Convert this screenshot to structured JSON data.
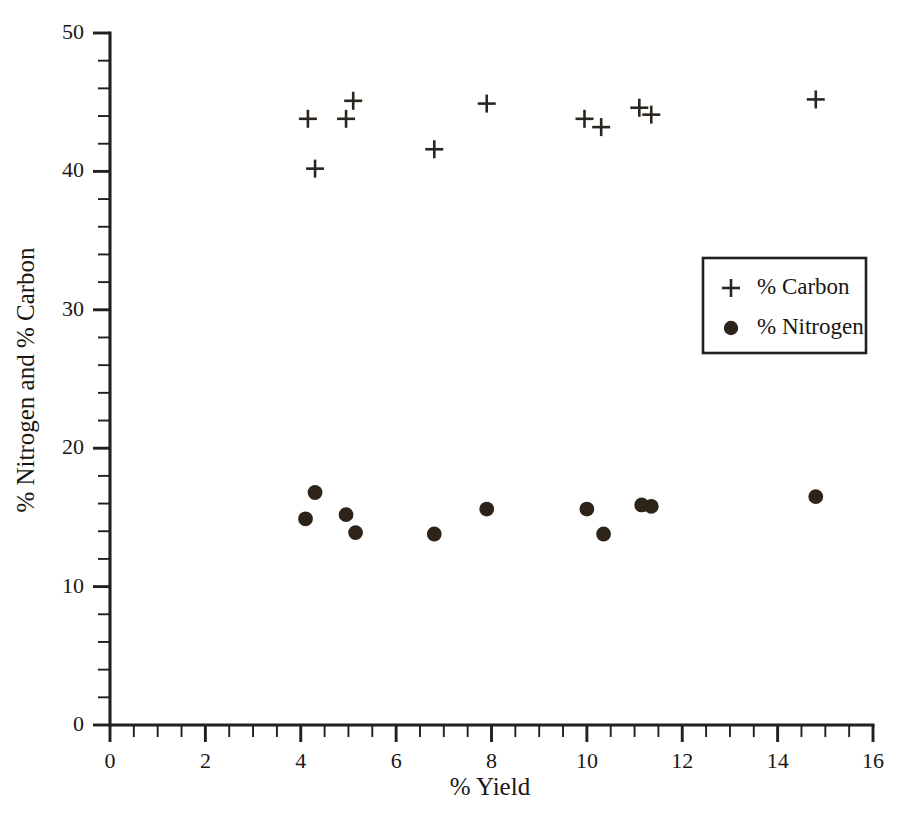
{
  "chart_data": {
    "type": "scatter",
    "title": "",
    "xlabel": "% Yield",
    "ylabel": "% Nitrogen and % Carbon",
    "xlim": [
      0,
      16
    ],
    "ylim": [
      0,
      50
    ],
    "x_major_ticks": [
      0,
      2,
      4,
      6,
      8,
      10,
      12,
      14,
      16
    ],
    "x_minor_step": 0.5,
    "y_major_ticks": [
      0,
      10,
      20,
      30,
      40,
      50
    ],
    "y_minor_step": 2,
    "x_tick_labels": [
      "0",
      "2",
      "4",
      "6",
      "8",
      "10",
      "12",
      "14",
      "16"
    ],
    "y_tick_labels": [
      "0",
      "10",
      "20",
      "30",
      "40",
      "50"
    ],
    "grid": false,
    "legend_position": "middle-right",
    "series": [
      {
        "name": "% Carbon",
        "marker": "plus",
        "color": "#2b2520",
        "points": [
          {
            "x": 4.15,
            "y": 43.8
          },
          {
            "x": 4.3,
            "y": 40.2
          },
          {
            "x": 4.95,
            "y": 43.8
          },
          {
            "x": 5.1,
            "y": 45.1
          },
          {
            "x": 6.8,
            "y": 41.6
          },
          {
            "x": 7.9,
            "y": 44.9
          },
          {
            "x": 9.95,
            "y": 43.8
          },
          {
            "x": 10.3,
            "y": 43.2
          },
          {
            "x": 11.1,
            "y": 44.6
          },
          {
            "x": 11.35,
            "y": 44.1
          },
          {
            "x": 14.8,
            "y": 45.2
          }
        ]
      },
      {
        "name": "% Nitrogen",
        "marker": "dot",
        "color": "#2d2318",
        "points": [
          {
            "x": 4.1,
            "y": 14.9
          },
          {
            "x": 4.3,
            "y": 16.8
          },
          {
            "x": 4.95,
            "y": 15.2
          },
          {
            "x": 5.15,
            "y": 13.9
          },
          {
            "x": 6.8,
            "y": 13.8
          },
          {
            "x": 7.9,
            "y": 15.6
          },
          {
            "x": 10.0,
            "y": 15.6
          },
          {
            "x": 10.35,
            "y": 13.8
          },
          {
            "x": 11.15,
            "y": 15.9
          },
          {
            "x": 11.35,
            "y": 15.8
          },
          {
            "x": 14.8,
            "y": 16.5
          }
        ]
      }
    ],
    "legend_entries": [
      {
        "label": "% Carbon",
        "marker": "plus"
      },
      {
        "label": "% Nitrogen",
        "marker": "dot"
      }
    ]
  }
}
